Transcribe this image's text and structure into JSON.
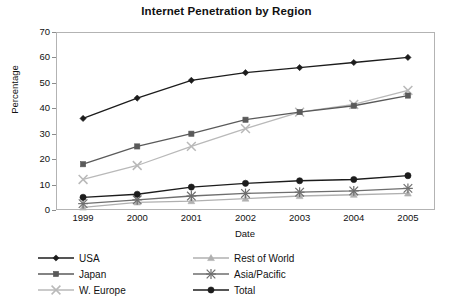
{
  "chart_data": {
    "type": "line",
    "title": "Internet Penetration by Region",
    "xlabel": "Date",
    "ylabel": "Percentage",
    "categories": [
      "1999",
      "2000",
      "2001",
      "2002",
      "2003",
      "2004",
      "2005"
    ],
    "x": [
      1999,
      2000,
      2001,
      2002,
      2003,
      2004,
      2005
    ],
    "ylim": [
      0,
      70
    ],
    "yticks": [
      0,
      10,
      20,
      30,
      40,
      50,
      60,
      70
    ],
    "grid": false,
    "legend_position": "below-plot",
    "series": [
      {
        "name": "USA",
        "values": [
          36,
          44,
          51,
          54,
          56,
          58,
          60
        ],
        "color": "#1c1c1c",
        "marker": "diamond"
      },
      {
        "name": "Japan",
        "values": [
          18,
          25,
          30,
          35.5,
          38.5,
          41,
          45
        ],
        "color": "#5a5a5a",
        "marker": "square"
      },
      {
        "name": "W. Europe",
        "values": [
          12,
          17.5,
          25,
          32,
          38.5,
          41.5,
          47
        ],
        "color": "#b9b9b9",
        "marker": "x"
      },
      {
        "name": "Rest of World",
        "values": [
          1,
          3,
          3.5,
          4.5,
          5.5,
          6,
          6.5
        ],
        "color": "#b0b0b0",
        "marker": "triangle"
      },
      {
        "name": "Asia/Pacific",
        "values": [
          2.5,
          4,
          5.5,
          6.5,
          7,
          7.5,
          8.5
        ],
        "color": "#6e6e6e",
        "marker": "asterisk"
      },
      {
        "name": "Total",
        "values": [
          5,
          6.2,
          9,
          10.5,
          11.5,
          12,
          13.5
        ],
        "color": "#1c1c1c",
        "marker": "circle"
      }
    ]
  },
  "legend": {
    "left_column": [
      "USA",
      "Japan",
      "W. Europe"
    ],
    "right_column": [
      "Rest of World",
      "Asia/Pacific",
      "Total"
    ]
  },
  "colors": {
    "frame": "#b3b3b3",
    "text": "#111111",
    "background": "#ffffff"
  }
}
